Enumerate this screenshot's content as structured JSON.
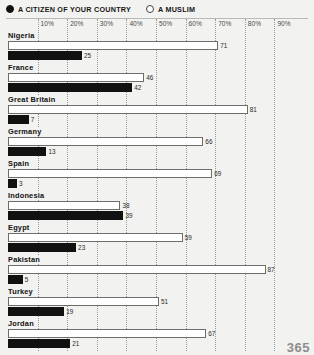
{
  "legend": {
    "entries": [
      {
        "label": "A CITIZEN OF YOUR COUNTRY",
        "marker": "filled-circle-icon"
      },
      {
        "label": "A MUSLIM",
        "marker": "hollow-circle-icon"
      }
    ]
  },
  "page_number": "365",
  "chart_data": {
    "type": "bar",
    "orientation": "horizontal",
    "title": "",
    "subtitle": "",
    "xlabel": "",
    "ylabel": "",
    "xlim": [
      0,
      100
    ],
    "grid": true,
    "legend_position": "top-left",
    "tick_labels": [
      "10%",
      "20%",
      "30%",
      "40%",
      "50%",
      "60%",
      "70%",
      "80%",
      "90%"
    ],
    "tick_values": [
      10,
      20,
      30,
      40,
      50,
      60,
      70,
      80,
      90
    ],
    "categories": [
      "Nigeria",
      "France",
      "Great Britain",
      "Germany",
      "Spain",
      "Indonesia",
      "Egypt",
      "Pakistan",
      "Turkey",
      "Jordan"
    ],
    "series": [
      {
        "name": "A MUSLIM",
        "style": "hollow",
        "values": [
          71,
          46,
          81,
          66,
          69,
          38,
          59,
          87,
          51,
          67
        ]
      },
      {
        "name": "A CITIZEN OF YOUR COUNTRY",
        "style": "filled",
        "values": [
          25,
          42,
          7,
          13,
          3,
          39,
          23,
          5,
          19,
          21
        ]
      }
    ]
  }
}
